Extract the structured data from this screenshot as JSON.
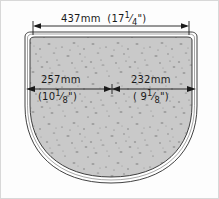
{
  "diagram": {
    "shape": {
      "name": "flat-top-rounded-bottom-outline",
      "fill_color": "#c9c9c9",
      "outline_color": "#2b2b2b",
      "rim_color": "#ffffff",
      "texture": "speckled-stone"
    },
    "background_color": "#fdfdfd",
    "border_color": "#d8d8d8"
  },
  "dimensions": {
    "overall_width": {
      "name": "overall-width",
      "metric": "437mm",
      "imperial_whole": "(17",
      "imperial_fraction_num": "1",
      "imperial_fraction_den": "4",
      "imperial_close": "\")",
      "full_text": "437mm  (17 1/4\")"
    },
    "left_segment": {
      "name": "left-segment-width",
      "metric": "257mm",
      "imperial_whole": "(10",
      "imperial_fraction_num": "1",
      "imperial_fraction_den": "8",
      "imperial_close": "\")",
      "full_text": "257mm (10 1/8\")"
    },
    "right_segment": {
      "name": "right-segment-width",
      "metric": "232mm",
      "imperial_whole": "( 9",
      "imperial_fraction_num": "1",
      "imperial_fraction_den": "8",
      "imperial_close": "\")",
      "full_text": "232mm ( 9 1/8\")"
    }
  }
}
